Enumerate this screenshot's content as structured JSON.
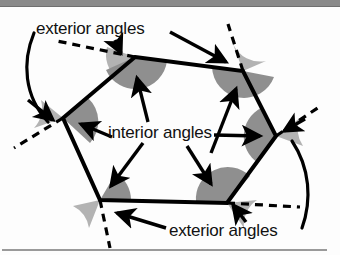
{
  "figure": {
    "shape": "irregular-hexagon",
    "labels": {
      "exterior_top": "exterior angles",
      "interior": "interior angles",
      "exterior_bottom": "exterior angles"
    },
    "colors": {
      "interior_wedge": "#8f8f8f",
      "exterior_wedge": "#b3b3b3",
      "stroke": "#000000",
      "background": "#fdfdfd",
      "top_bar": "#8a8a8a",
      "bottom_rule": "#9a9a9a",
      "text": "#111111"
    },
    "vertices": [
      {
        "name": "top-left",
        "x": 135,
        "y": 57
      },
      {
        "name": "top-right",
        "x": 243,
        "y": 71
      },
      {
        "name": "right",
        "x": 276,
        "y": 136
      },
      {
        "name": "bottom-right",
        "x": 227,
        "y": 203
      },
      {
        "name": "bottom-left",
        "x": 100,
        "y": 200
      },
      {
        "name": "left",
        "x": 63,
        "y": 118
      }
    ],
    "interior_angle_count": 6,
    "exterior_angle_count": 6,
    "dashed_extension_count": 6,
    "arc_count": 2
  }
}
